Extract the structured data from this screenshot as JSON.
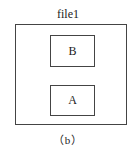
{
  "diagram": {
    "container": {
      "label": "file1"
    },
    "boxes": [
      {
        "label": "B"
      },
      {
        "label": "A"
      }
    ],
    "caption": "（b）"
  }
}
